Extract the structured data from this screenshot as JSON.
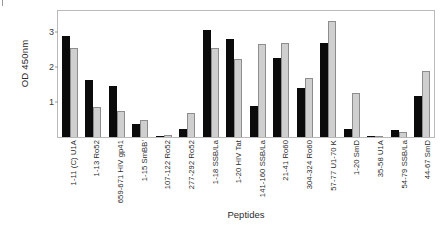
{
  "chart_data": {
    "type": "bar",
    "title": "",
    "xlabel": "Peptides",
    "ylabel": "OD 450nm",
    "ylim": [
      0,
      3.6
    ],
    "yticks": [
      1,
      2,
      3
    ],
    "grid": false,
    "legend": "none",
    "categories": [
      "1-11 (C) U1A",
      "1-13 Ro52",
      "659-671 HIV gp41",
      "1-15 SmBB'",
      "107-122 Ro52",
      "277-292 Ro52",
      "1-18 SSB/La",
      "1-20 HIV Tat",
      "141-160 SSB/La",
      "21-41 Ro60",
      "304-324 Ro60",
      "57-77 U1-70 K",
      "1-20 SmD",
      "35-58 U1A",
      "54-79 SSB/La",
      "44-67 SmD"
    ],
    "series": [
      {
        "name": "black",
        "color": "#0b0b0b",
        "values": [
          2.88,
          1.62,
          1.47,
          0.38,
          0.04,
          0.23,
          3.05,
          2.81,
          0.88,
          2.25,
          1.39,
          2.69,
          0.23,
          0.03,
          0.19,
          1.17
        ]
      },
      {
        "name": "gray",
        "color": "#cfcfcf",
        "values": [
          2.55,
          0.86,
          0.75,
          0.5,
          0.05,
          0.7,
          2.55,
          2.23,
          2.65,
          2.68,
          1.68,
          3.32,
          1.25,
          0.04,
          0.15,
          1.88
        ]
      }
    ]
  },
  "axis": {
    "y_title": "OD 450nm",
    "x_title": "Peptides",
    "tick_labels": [
      "3",
      "2",
      "1"
    ]
  }
}
